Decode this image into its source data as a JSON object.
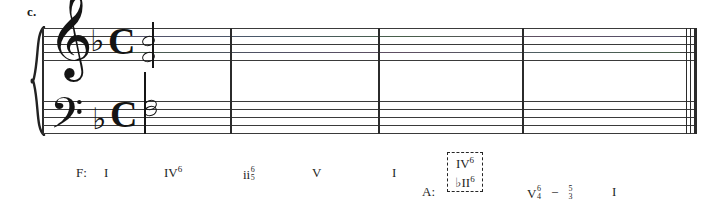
{
  "exercise": {
    "label": "c."
  },
  "score": {
    "clefs": {
      "treble": "treble-clef",
      "bass": "bass-clef"
    },
    "key_signature": {
      "accidental": "♭",
      "count": 1,
      "name": "F major"
    },
    "time_signature": {
      "symbol": "C",
      "name": "common-time"
    },
    "measures": 4,
    "final_barline": "double-thin-thick"
  },
  "analysis": {
    "home_key_label": "F:",
    "modulation_key_label": "A:",
    "chords": [
      {
        "numeral": "I",
        "figure_top": "",
        "figure_bottom": ""
      },
      {
        "numeral": "IV",
        "figure_top": "6",
        "figure_bottom": ""
      },
      {
        "numeral": "ii",
        "figure_top": "6",
        "figure_bottom": "5"
      },
      {
        "numeral": "V",
        "figure_top": "",
        "figure_bottom": ""
      },
      {
        "numeral": "I",
        "figure_top": "",
        "figure_bottom": ""
      }
    ],
    "pivot": {
      "top_numeral": "IV",
      "top_figure": "6",
      "bottom_numeral": "♭II",
      "bottom_figure": "6",
      "boxed": true
    },
    "cadence": {
      "numeral": "V",
      "figure_top": "6",
      "figure_bottom": "4",
      "connector": "–",
      "resolve_top": "5",
      "resolve_bottom": "3",
      "final_numeral": "I"
    }
  }
}
